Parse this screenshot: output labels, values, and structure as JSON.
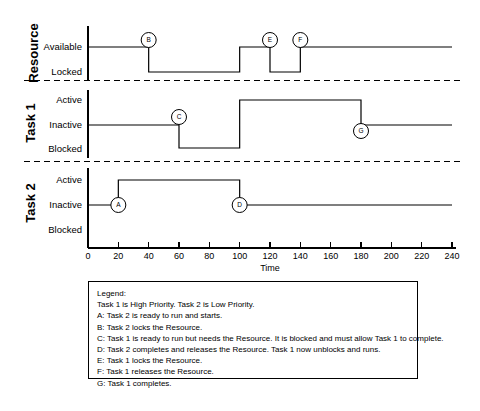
{
  "chart_data": {
    "type": "line",
    "title": "",
    "xlabel": "Time",
    "ylabel": "",
    "xlim": [
      0,
      240
    ],
    "xticks": [
      0,
      20,
      40,
      60,
      80,
      100,
      120,
      140,
      160,
      180,
      200,
      220,
      240
    ],
    "grid": false,
    "legend_position": "below-plot",
    "bands": [
      {
        "name": "Resource",
        "states": [
          "Available",
          "Locked"
        ],
        "steps": [
          {
            "t": 0,
            "state": "Available"
          },
          {
            "t": 40,
            "state": "Locked"
          },
          {
            "t": 100,
            "state": "Available"
          },
          {
            "t": 120,
            "state": "Locked"
          },
          {
            "t": 140,
            "state": "Available"
          },
          {
            "t": 240,
            "state": "Available"
          }
        ],
        "markers": [
          {
            "label": "B",
            "t": 40
          },
          {
            "label": "E",
            "t": 120
          },
          {
            "label": "F",
            "t": 140
          }
        ]
      },
      {
        "name": "Task 1",
        "states": [
          "Active",
          "Inactive",
          "Blocked"
        ],
        "steps": [
          {
            "t": 0,
            "state": "Inactive"
          },
          {
            "t": 60,
            "state": "Blocked"
          },
          {
            "t": 100,
            "state": "Active"
          },
          {
            "t": 180,
            "state": "Inactive"
          },
          {
            "t": 240,
            "state": "Inactive"
          }
        ],
        "markers": [
          {
            "label": "C",
            "t": 60
          },
          {
            "label": "G",
            "t": 180
          }
        ]
      },
      {
        "name": "Task 2",
        "states": [
          "Active",
          "Inactive",
          "Blocked"
        ],
        "steps": [
          {
            "t": 0,
            "state": "Inactive"
          },
          {
            "t": 20,
            "state": "Active"
          },
          {
            "t": 100,
            "state": "Inactive"
          },
          {
            "t": 240,
            "state": "Inactive"
          }
        ],
        "markers": [
          {
            "label": "A",
            "t": 20
          },
          {
            "label": "D",
            "t": 100
          }
        ]
      }
    ]
  },
  "axis": {
    "title": "Time",
    "tick_labels": [
      "0",
      "20",
      "40",
      "60",
      "80",
      "100",
      "120",
      "140",
      "160",
      "180",
      "200",
      "220",
      "240"
    ]
  },
  "bands": [
    {
      "title": "Resource",
      "state_labels": [
        "Available",
        "Locked"
      ]
    },
    {
      "title": "Task 1",
      "state_labels": [
        "Active",
        "Inactive",
        "Blocked"
      ]
    },
    {
      "title": "Task 2",
      "state_labels": [
        "Active",
        "Inactive",
        "Blocked"
      ]
    }
  ],
  "markers": [
    {
      "label": "A"
    },
    {
      "label": "B"
    },
    {
      "label": "C"
    },
    {
      "label": "D"
    },
    {
      "label": "E"
    },
    {
      "label": "F"
    },
    {
      "label": "G"
    }
  ],
  "legend": {
    "heading": "Legend:",
    "lines": [
      "Task 1 is High Priority. Task 2 is Low Priority.",
      "A: Task 2 is ready to run and starts.",
      "B: Task 2 locks the Resource.",
      "C: Task 1 is ready to run but needs the Resource. It is blocked and must allow Task 1 to complete.",
      "D: Task 2 completes and releases the Resource. Task 1 now unblocks and runs.",
      "E: Task 1 locks the Resource.",
      "F: Task 1 releases the Resource.",
      "G: Task 1 completes."
    ]
  },
  "colors": {
    "line": "#000000",
    "background": "#ffffff",
    "separator": "#000000"
  }
}
